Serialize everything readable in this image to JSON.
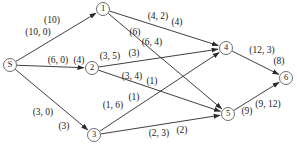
{
  "figure": {
    "width": 297,
    "height": 148,
    "background_color": "#ffffff",
    "line_color": "#2a2a2a",
    "node_fill_color": "#ffffff",
    "node_stroke_color": "#4a4a4a",
    "text_color": "#1c1c1c",
    "node_radius": 6.5
  },
  "nodes": [
    {
      "id": "S",
      "label": "S",
      "x": 10,
      "y": 65
    },
    {
      "id": "1",
      "label": "1",
      "x": 103,
      "y": 9
    },
    {
      "id": "2",
      "label": "2",
      "x": 92,
      "y": 68
    },
    {
      "id": "3",
      "label": "3",
      "x": 94,
      "y": 135
    },
    {
      "id": "4",
      "label": "4",
      "x": 226,
      "y": 48
    },
    {
      "id": "5",
      "label": "5",
      "x": 228,
      "y": 114
    },
    {
      "id": "6",
      "label": "6",
      "x": 286,
      "y": 78
    }
  ],
  "edges": [
    {
      "from": "S",
      "to": "1",
      "labels": [
        {
          "text": "(10)",
          "x": 52,
          "y": 21
        },
        {
          "text": "(10, 0)",
          "x": 38,
          "y": 33
        }
      ]
    },
    {
      "from": "S",
      "to": "2",
      "labels": [
        {
          "text": "(6, 0)",
          "x": 58,
          "y": 61
        },
        {
          "text": "(4)",
          "x": 79,
          "y": 61
        }
      ]
    },
    {
      "from": "S",
      "to": "3",
      "labels": [
        {
          "text": "(3, 0)",
          "x": 43,
          "y": 113
        },
        {
          "text": "(3)",
          "x": 64,
          "y": 127
        }
      ]
    },
    {
      "from": "1",
      "to": "4",
      "labels": [
        {
          "text": "(4, 2)",
          "x": 158,
          "y": 17
        },
        {
          "text": "(4)",
          "x": 177,
          "y": 23
        }
      ]
    },
    {
      "from": "1",
      "to": "5",
      "labels": [
        {
          "text": "(6)",
          "x": 135,
          "y": 33
        },
        {
          "text": "(6, 4)",
          "x": 152,
          "y": 43
        }
      ]
    },
    {
      "from": "2",
      "to": "4",
      "labels": [
        {
          "text": "(3, 5)",
          "x": 110,
          "y": 57
        },
        {
          "text": "(3)",
          "x": 134,
          "y": 54
        }
      ]
    },
    {
      "from": "2",
      "to": "5",
      "labels": [
        {
          "text": "(3, 4)",
          "x": 132,
          "y": 77
        },
        {
          "text": "(1)",
          "x": 152,
          "y": 82
        }
      ]
    },
    {
      "from": "3",
      "to": "4",
      "labels": [
        {
          "text": "(1, 6)",
          "x": 113,
          "y": 106
        },
        {
          "text": "(1)",
          "x": 134,
          "y": 98
        }
      ]
    },
    {
      "from": "3",
      "to": "5",
      "labels": [
        {
          "text": "(2, 3)",
          "x": 159,
          "y": 134
        },
        {
          "text": "(2)",
          "x": 182,
          "y": 131
        }
      ]
    },
    {
      "from": "4",
      "to": "6",
      "labels": [
        {
          "text": "(12, 3)",
          "x": 262,
          "y": 51
        },
        {
          "text": "(8)",
          "x": 279,
          "y": 62
        }
      ]
    },
    {
      "from": "5",
      "to": "6",
      "labels": [
        {
          "text": "(9)",
          "x": 247,
          "y": 112
        },
        {
          "text": "(9, 12)",
          "x": 268,
          "y": 105
        }
      ]
    }
  ]
}
